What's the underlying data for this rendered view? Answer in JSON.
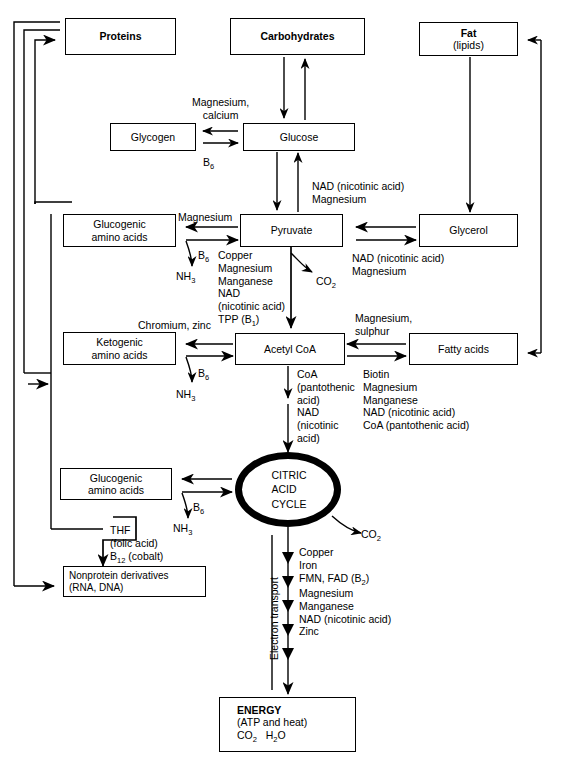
{
  "figure": {
    "type": "metabolic-pathway-flowchart"
  },
  "nodes": {
    "proteins": {
      "l1": "Proteins"
    },
    "carbs": {
      "l1": "Carbohydrates"
    },
    "fat": {
      "l1": "Fat",
      "l2": "(lipids)"
    },
    "glycogen": {
      "l1": "Glycogen"
    },
    "glucose": {
      "l1": "Glucose"
    },
    "glucogenic1": {
      "l1": "Glucogenic",
      "l2": "amino acids"
    },
    "pyruvate": {
      "l1": "Pyruvate"
    },
    "glycerol": {
      "l1": "Glycerol"
    },
    "ketogenic": {
      "l1": "Ketogenic",
      "l2": "amino acids"
    },
    "acetylcoa": {
      "l1": "Acetyl CoA"
    },
    "fattyacids": {
      "l1": "Fatty acids"
    },
    "glucogenic2": {
      "l1": "Glucogenic",
      "l2": "amino acids"
    },
    "citric": {
      "l1": "CITRIC",
      "l2": "ACID",
      "l3": "CYCLE"
    },
    "nonprotein": {
      "l1": "Nonprotein derivatives",
      "l2": "(RNA, DNA)"
    },
    "energy": {
      "l1": "ENERGY",
      "l2": "(ATP and heat)",
      "l3": "CO2   H2O"
    }
  },
  "cofactors": {
    "glycogen_glucose": "Magnesium,\ncalcium",
    "glycogen_b6": "B6",
    "glucose_pyruvate": "NAD (nicotinic acid)\nMagnesium",
    "pyr_gluco_mg": "Magnesium",
    "pyr_gluco_b6": "B6",
    "pyr_gluco_nh3": "NH3",
    "pyr_acetyl_list": "Copper\nMagnesium\nManganese\nNAD\n(nicotinic acid)\nTPP (B1)",
    "pyr_acetyl_chrom": "Chromium, zinc",
    "pyruvate_co2": "CO2",
    "glycerol_nad": "NAD (nicotinic acid)\nMagnesium",
    "acetyl_fatty": "Magnesium,\nsulphur",
    "fatty_list": "Biotin\nMagnesium\nManganese\nNAD (nicotinic acid)\nCoA  (pantothenic acid)",
    "keto_b6": "B6",
    "keto_nh3": "NH3",
    "acetyl_cac_list": "CoA\n(pantothenic\nacid)\nNAD\n(nicotinic\nacid)",
    "cac_gluco_b6": "B6",
    "cac_gluco_nh3": "NH3",
    "cac_co2": "CO2",
    "thf": "THF\n(folic acid)",
    "b12": "B12 (cobalt)",
    "electron_transport": "Electron transport",
    "etc_list": "Copper\nIron\nFMN, FAD (B2)\nMagnesium\nManganese\nNAD (nicotinic acid)\nZinc"
  },
  "caption": "1   Overview of carbohydrate, protein and fat metabolism",
  "colors": {
    "ink": "#000000",
    "paper": "#ffffff"
  }
}
